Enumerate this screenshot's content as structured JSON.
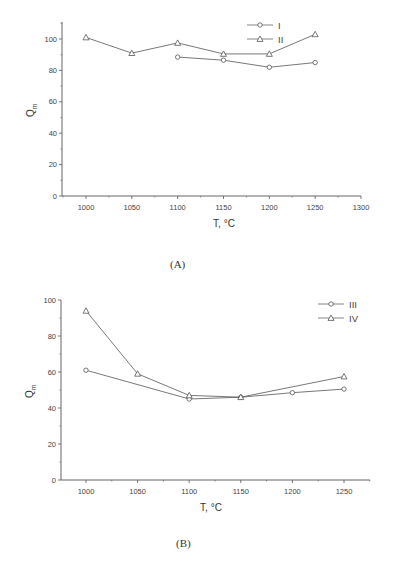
{
  "figures": [
    {
      "caption": "(A)",
      "xlabel": "T, °C",
      "ylabel": "Q",
      "ylabel_sub": "m",
      "legend": [
        {
          "label": "I",
          "marker": "circle"
        },
        {
          "label": "II",
          "marker": "triangle"
        }
      ]
    },
    {
      "caption": "(B)",
      "xlabel": "T, °C",
      "ylabel": "Q",
      "ylabel_sub": "m",
      "legend": [
        {
          "label": "III",
          "marker": "circle"
        },
        {
          "label": "IV",
          "marker": "triangle"
        }
      ]
    }
  ],
  "chart_data": [
    {
      "type": "line",
      "title": "(A)",
      "xlabel": "T, °C",
      "ylabel": "Q_m",
      "xlim": [
        975,
        1300
      ],
      "ylim": [
        0,
        110
      ],
      "xticks": [
        1000,
        1050,
        1100,
        1150,
        1200,
        1250,
        1300
      ],
      "yticks": [
        0,
        20,
        40,
        60,
        80,
        100
      ],
      "grid": false,
      "legend_position": "top-right",
      "series": [
        {
          "name": "I",
          "marker": "circle",
          "x": [
            1100,
            1150,
            1200,
            1250
          ],
          "values": [
            88.5,
            86.5,
            82,
            85
          ]
        },
        {
          "name": "II",
          "marker": "triangle",
          "x": [
            1000,
            1050,
            1100,
            1150,
            1200,
            1250
          ],
          "values": [
            101,
            91,
            97.5,
            90.5,
            90.5,
            103
          ]
        }
      ]
    },
    {
      "type": "line",
      "title": "(B)",
      "xlabel": "T, °C",
      "ylabel": "Q_m",
      "xlim": [
        975,
        1275
      ],
      "ylim": [
        0,
        100
      ],
      "xticks": [
        1000,
        1050,
        1100,
        1150,
        1200,
        1250
      ],
      "yticks": [
        0,
        20,
        40,
        60,
        80,
        100
      ],
      "grid": false,
      "legend_position": "top-right",
      "series": [
        {
          "name": "III",
          "marker": "circle",
          "x": [
            1000,
            1100,
            1150,
            1200,
            1250
          ],
          "values": [
            61,
            45,
            46,
            48.5,
            50.5
          ]
        },
        {
          "name": "IV",
          "marker": "triangle",
          "x": [
            1000,
            1050,
            1100,
            1150,
            1250
          ],
          "values": [
            94,
            59,
            47,
            46,
            57.5
          ]
        }
      ]
    }
  ]
}
